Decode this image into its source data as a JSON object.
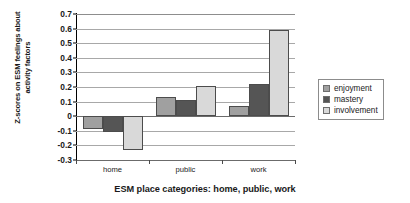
{
  "chart_data": {
    "type": "bar",
    "title": "",
    "xlabel": "ESM place categories:  home, public, work",
    "ylabel": "Z-scores on ESM feelings about\nactivity factors",
    "categories": [
      "home",
      "public",
      "work"
    ],
    "series": [
      {
        "name": "enjoyment",
        "values": [
          -0.09,
          0.13,
          0.07
        ],
        "color": "#a0a0a0"
      },
      {
        "name": "mastery",
        "values": [
          -0.11,
          0.11,
          0.22
        ],
        "color": "#555555"
      },
      {
        "name": "involvement",
        "values": [
          -0.23,
          0.21,
          0.59
        ],
        "color": "#d9d9d9"
      }
    ],
    "ylim": [
      -0.3,
      0.7
    ],
    "ytick_values": [
      0.7,
      0.6,
      0.5,
      0.4,
      0.3,
      0.2,
      0.1,
      0,
      -0.1,
      -0.2,
      -0.3
    ],
    "ytick_labels": [
      "0.7",
      "0.6",
      "0.5",
      "0.4",
      "0.3",
      "0.2",
      "0.1",
      "0",
      "-0.1",
      "-0.2",
      "-0.3"
    ],
    "grid": true,
    "legend_position": "right"
  },
  "legend": {
    "items": [
      {
        "label": "enjoyment"
      },
      {
        "label": "mastery"
      },
      {
        "label": "involvement"
      }
    ]
  }
}
